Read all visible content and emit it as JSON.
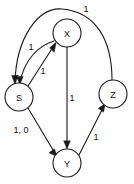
{
  "diagram": {
    "type": "directed-weighted-graph",
    "title": "",
    "nodes": [
      {
        "id": "S",
        "label": "S",
        "cx": 19,
        "cy": 97,
        "r": 14
      },
      {
        "id": "X",
        "label": "X",
        "cx": 67,
        "cy": 33,
        "r": 14
      },
      {
        "id": "Z",
        "label": "Z",
        "cx": 113,
        "cy": 94,
        "r": 14
      },
      {
        "id": "Y",
        "label": "Y",
        "cx": 67,
        "cy": 163,
        "r": 14
      }
    ],
    "edges": [
      {
        "id": "z-to-s",
        "from": "Z",
        "to": "S",
        "weight": "1",
        "label_x": 86,
        "label_y": 9
      },
      {
        "id": "x-to-s",
        "from": "X",
        "to": "S",
        "weight": "1",
        "label_x": 31,
        "label_y": 47
      },
      {
        "id": "s-to-x",
        "from": "S",
        "to": "X",
        "weight": "1",
        "label_x": 43,
        "label_y": 71
      },
      {
        "id": "x-to-y",
        "from": "X",
        "to": "Y",
        "weight": "1",
        "label_x": 72,
        "label_y": 98
      },
      {
        "id": "s-to-y",
        "from": "S",
        "to": "Y",
        "weight": "1, 0",
        "label_x": 21,
        "label_y": 130
      },
      {
        "id": "y-to-z",
        "from": "Y",
        "to": "Z",
        "weight": "1",
        "label_x": 96,
        "label_y": 137
      }
    ],
    "colors": {
      "node_stroke": "#1a1a1a",
      "node_fill": "#ffffff",
      "edge_stroke": "#1a1a1a",
      "text": "#111111",
      "background": "#fefefe"
    }
  }
}
